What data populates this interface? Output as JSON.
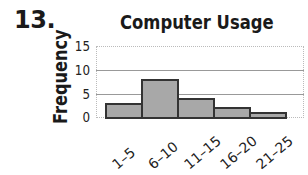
{
  "problem_number": "13.",
  "chart_data": {
    "type": "bar",
    "title": "Computer Usage",
    "xlabel": "",
    "ylabel": "Frequency",
    "categories": [
      "1–5",
      "6–10",
      "11–15",
      "16–20",
      "21–25"
    ],
    "values": [
      3,
      8,
      4,
      2,
      1
    ],
    "ylim": [
      0,
      15
    ],
    "yticks": [
      "15",
      "10",
      "5",
      "0"
    ],
    "grid": true,
    "histogram": true,
    "bar_color": "#a8a8a8",
    "bar_edge_color": "#333333"
  }
}
